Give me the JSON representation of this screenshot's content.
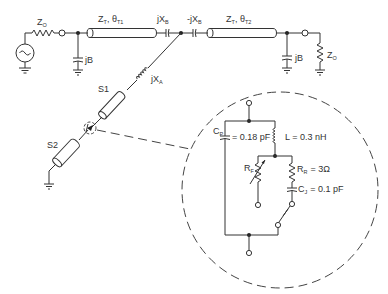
{
  "diagram": {
    "type": "circuit-schematic",
    "main_line": {
      "source_impedance": {
        "main": "Z",
        "sub": "O"
      },
      "shunt_susceptance_left": "jB",
      "line1": {
        "z": "Z",
        "z_sub": "T",
        "theta": "θ",
        "theta_sub": "T1"
      },
      "series_cap_left": {
        "main": "jX",
        "sub": "B"
      },
      "series_cap_right": {
        "main": "-jX",
        "sub": "B"
      },
      "line2": {
        "z": "Z",
        "z_sub": "T",
        "theta": "θ",
        "theta_sub": "T2"
      },
      "shunt_susceptance_right": "jB",
      "load_impedance": {
        "main": "Z",
        "sub": "O"
      }
    },
    "branch": {
      "series_inductor": {
        "main": "jX",
        "sub": "A"
      },
      "stub1": "S1",
      "stub2": "S2"
    },
    "diode_model": {
      "package_cap": {
        "main": "C",
        "sub": "P",
        "value": "= 0.18 pF"
      },
      "inductance": {
        "value": "L = 0.3 nH"
      },
      "variable_resistor": {
        "main": "R",
        "sub": "F"
      },
      "series_resistance": {
        "main": "R",
        "sub": "R",
        "value": "= 3Ω"
      },
      "junction_cap": {
        "main": "C",
        "sub": "J",
        "value": "= 0.1 pF"
      }
    }
  }
}
